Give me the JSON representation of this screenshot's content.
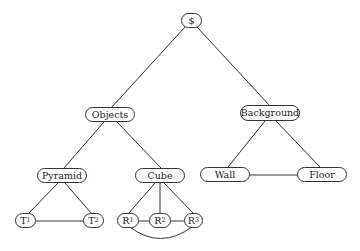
{
  "diagram": {
    "type": "semantic-network-tree",
    "nodes": [
      {
        "id": "root",
        "label": "$",
        "sub": "",
        "x": 181,
        "y": 13,
        "w": 21,
        "h": 15
      },
      {
        "id": "objects",
        "label": "Objects",
        "sub": "",
        "x": 85,
        "y": 107,
        "w": 50,
        "h": 15
      },
      {
        "id": "background",
        "label": "Background",
        "sub": "",
        "x": 240,
        "y": 105,
        "w": 60,
        "h": 16
      },
      {
        "id": "pyramid",
        "label": "Pyramid",
        "sub": "",
        "x": 37,
        "y": 168,
        "w": 50,
        "h": 15
      },
      {
        "id": "cube",
        "label": "Cube",
        "sub": "",
        "x": 135,
        "y": 168,
        "w": 50,
        "h": 15
      },
      {
        "id": "wall",
        "label": "Wall",
        "sub": "",
        "x": 200,
        "y": 167,
        "w": 50,
        "h": 15
      },
      {
        "id": "floor",
        "label": "Floor",
        "sub": "",
        "x": 297,
        "y": 167,
        "w": 50,
        "h": 15
      },
      {
        "id": "t1",
        "label": "T",
        "sub": "1",
        "x": 15,
        "y": 213,
        "w": 21,
        "h": 15
      },
      {
        "id": "t2",
        "label": "T",
        "sub": "2",
        "x": 83,
        "y": 213,
        "w": 21,
        "h": 15
      },
      {
        "id": "r1",
        "label": "R",
        "sub": "1",
        "x": 117,
        "y": 213,
        "w": 22,
        "h": 15
      },
      {
        "id": "r2",
        "label": "R",
        "sub": "2",
        "x": 149,
        "y": 213,
        "w": 22,
        "h": 15
      },
      {
        "id": "r3",
        "label": "R",
        "sub": "3",
        "x": 184,
        "y": 213,
        "w": 19,
        "h": 15
      }
    ],
    "edges": [
      {
        "from": "root",
        "to": "objects"
      },
      {
        "from": "root",
        "to": "background"
      },
      {
        "from": "objects",
        "to": "pyramid"
      },
      {
        "from": "objects",
        "to": "cube"
      },
      {
        "from": "background",
        "to": "wall"
      },
      {
        "from": "background",
        "to": "floor"
      },
      {
        "from": "wall",
        "to": "floor"
      },
      {
        "from": "pyramid",
        "to": "t1"
      },
      {
        "from": "pyramid",
        "to": "t2"
      },
      {
        "from": "t1",
        "to": "t2"
      },
      {
        "from": "cube",
        "to": "r1"
      },
      {
        "from": "cube",
        "to": "r2"
      },
      {
        "from": "cube",
        "to": "r3"
      },
      {
        "from": "r1",
        "to": "r2"
      },
      {
        "from": "r2",
        "to": "r3"
      },
      {
        "from": "r1",
        "to": "r3",
        "curved": true
      }
    ]
  },
  "labels": {
    "root": "$",
    "objects": "Objects",
    "background": "Background",
    "pyramid": "Pyramid",
    "cube": "Cube",
    "wall": "Wall",
    "floor": "Floor",
    "t1": "T",
    "t1_sub": "1",
    "t2": "T",
    "t2_sub": "2",
    "r1": "R",
    "r1_sub": "1",
    "r2": "R",
    "r2_sub": "2",
    "r3": "R",
    "r3_sub": "3"
  }
}
